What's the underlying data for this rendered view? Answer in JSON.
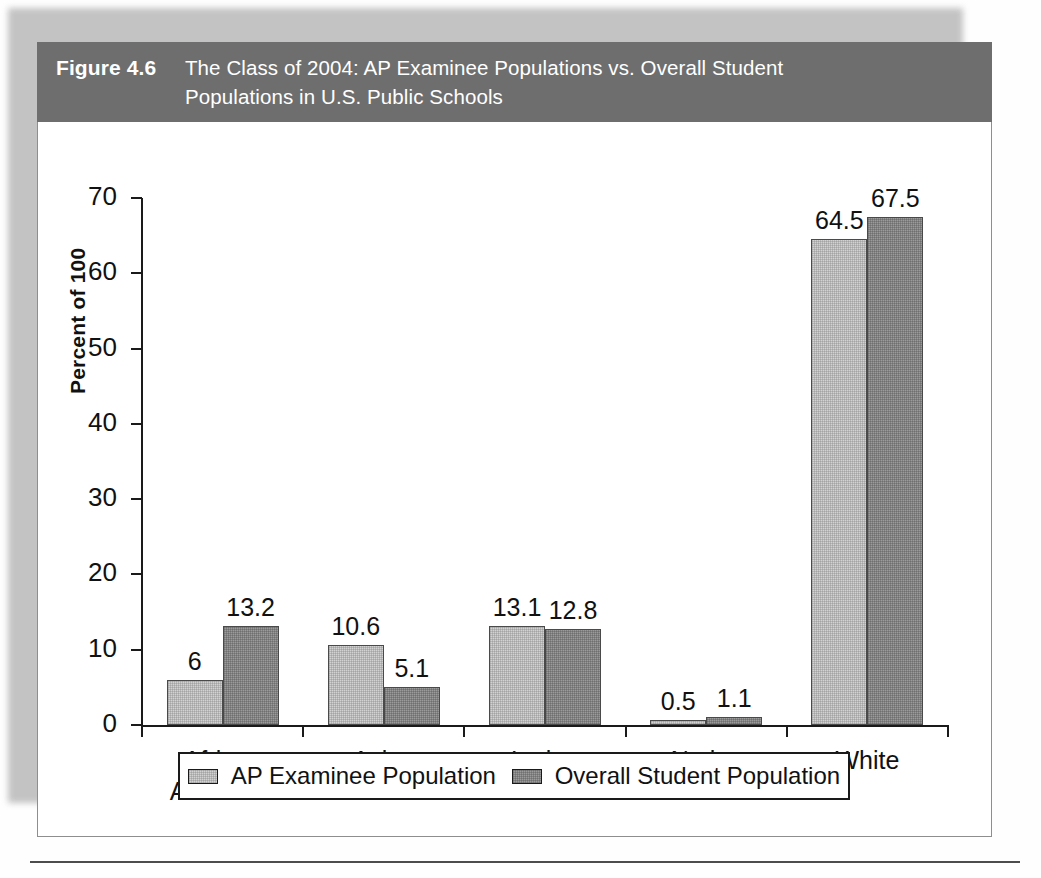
{
  "figure": {
    "number_label": "Figure 4.6",
    "title_line1": "The Class of 2004: AP Examinee Populations vs. Overall Student",
    "title_line2": "Populations in U.S. Public Schools",
    "header_bg": "#6e6e6e",
    "header_text_color": "#ffffff"
  },
  "chart_data": {
    "type": "bar",
    "title": "The Class of 2004: AP Examinee Populations vs. Overall Student Populations in U.S. Public Schools",
    "xlabel": "",
    "ylabel": "Percent of 100",
    "ylim": [
      0,
      70
    ],
    "yticks": [
      0,
      10,
      20,
      30,
      40,
      50,
      60,
      70
    ],
    "ytick_labels": [
      "0",
      "10",
      "20",
      "30",
      "40",
      "50",
      "60",
      "70"
    ],
    "grid": false,
    "legend_position": "bottom",
    "categories": [
      "African\nAmerican",
      "Asian",
      "Latino",
      "Native\nAmerican",
      "White"
    ],
    "category_labels": [
      [
        "African",
        "American"
      ],
      [
        "Asian"
      ],
      [
        "Latino"
      ],
      [
        "Native",
        "American"
      ],
      [
        "White"
      ]
    ],
    "series": [
      {
        "name": "AP Examinee Population",
        "color": "#d2d2d2",
        "values": [
          6,
          10.6,
          13.1,
          0.5,
          64.5
        ],
        "value_labels": [
          "6",
          "10.6",
          "13.1",
          "0.5",
          "64.5"
        ]
      },
      {
        "name": "Overall Student Population",
        "color": "#9b9b9b",
        "values": [
          13.2,
          5.1,
          12.8,
          1.1,
          67.5
        ],
        "value_labels": [
          "13.2",
          "5.1",
          "12.8",
          "1.1",
          "67.5"
        ]
      }
    ]
  }
}
